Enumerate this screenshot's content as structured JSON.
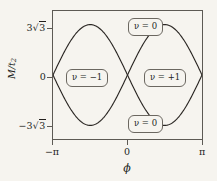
{
  "figure": {
    "background_color": "#f6f4ef",
    "frame_color": "#5d5a54",
    "curve_color": "#2b2724"
  },
  "axes": {
    "x": {
      "label": "ϕ",
      "ticks": [
        "−π",
        "0",
        "π"
      ],
      "tick_values": [
        -3.14159,
        0,
        3.14159
      ],
      "range": [
        -3.14159,
        3.14159
      ]
    },
    "y": {
      "label": "M/t",
      "label_sub": "2",
      "ticks": [
        "3√3",
        "0",
        "−3√3"
      ],
      "tick_values": [
        5.19615,
        0,
        -5.19615
      ],
      "range": [
        -6.6,
        6.6
      ]
    }
  },
  "badges": [
    {
      "id": "top",
      "text": "ν = 0"
    },
    {
      "id": "left",
      "text": "ν = −1"
    },
    {
      "id": "right",
      "text": "ν = +1"
    },
    {
      "id": "bottom",
      "text": "ν = 0"
    }
  ],
  "chart_data": {
    "type": "line",
    "title": "",
    "xlabel": "ϕ",
    "ylabel": "M/t2",
    "xlim": [
      -3.14159,
      3.14159
    ],
    "ylim": [
      -6.6,
      6.6
    ],
    "grid": false,
    "legend": null,
    "xtick_labels": [
      "−π",
      "0",
      "π"
    ],
    "xtick_values": [
      -3.14159,
      0,
      3.14159
    ],
    "ytick_labels": [
      "3√3",
      "0",
      "−3√3"
    ],
    "ytick_values": [
      5.19615,
      0,
      -5.19615
    ],
    "series": [
      {
        "name": "M = 3√3 t2 sin(ϕ)",
        "formula": "3*sqrt(3)*sin(phi)",
        "x": [
          -3.14159,
          -2.74889,
          -2.35619,
          -1.9635,
          -1.5708,
          -1.1781,
          -0.7854,
          -0.3927,
          0.0,
          0.3927,
          0.7854,
          1.1781,
          1.5708,
          1.9635,
          2.35619,
          2.74889,
          3.14159
        ],
        "y": [
          0.0,
          -1.98869,
          -3.67423,
          -4.8003,
          -5.19615,
          -4.8003,
          -3.67423,
          -1.98869,
          0.0,
          1.98869,
          3.67423,
          4.8003,
          5.19615,
          4.8003,
          3.67423,
          1.98869,
          0.0
        ]
      },
      {
        "name": "M = −3√3 t2 sin(ϕ)",
        "formula": "-3*sqrt(3)*sin(phi)",
        "x": [
          -3.14159,
          -2.74889,
          -2.35619,
          -1.9635,
          -1.5708,
          -1.1781,
          -0.7854,
          -0.3927,
          0.0,
          0.3927,
          0.7854,
          1.1781,
          1.5708,
          1.9635,
          2.35619,
          2.74889,
          3.14159
        ],
        "y": [
          0.0,
          1.98869,
          3.67423,
          4.8003,
          5.19615,
          4.8003,
          3.67423,
          1.98869,
          0.0,
          -1.98869,
          -3.67423,
          -4.8003,
          -5.19615,
          -4.8003,
          -3.67423,
          -1.98869,
          0.0
        ]
      }
    ],
    "annotations": [
      {
        "text": "ν = 0",
        "x": 0.0,
        "y": 5.9
      },
      {
        "text": "ν = −1",
        "x": -1.57,
        "y": 0.0
      },
      {
        "text": "ν = +1",
        "x": 1.57,
        "y": 0.0
      },
      {
        "text": "ν = 0",
        "x": 0.0,
        "y": -5.9
      }
    ]
  }
}
